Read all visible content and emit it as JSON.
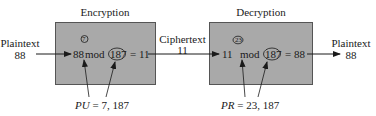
{
  "encryption": {
    "title": "Encryption",
    "base": "88",
    "exponent": "7",
    "mod_label": "mod",
    "modulus": "187",
    "result": "= 11",
    "key_label_var": "PU",
    "key_label_value": " = 7, 187"
  },
  "decryption": {
    "title": "Decryption",
    "base": "11",
    "exponent": "23",
    "mod_label": "mod",
    "modulus": "187",
    "result": "= 88",
    "key_label_var": "PR",
    "key_label_value": " = 23, 187"
  },
  "input": {
    "label": "Plaintext",
    "value": "88"
  },
  "ciphertext": {
    "label": "Ciphertext",
    "value": "11"
  },
  "output": {
    "label": "Plaintext",
    "value": "88"
  },
  "colors": {
    "box_fill": "#a9a9a9",
    "box_border": "#555555",
    "ink": "#1a1a1a"
  }
}
